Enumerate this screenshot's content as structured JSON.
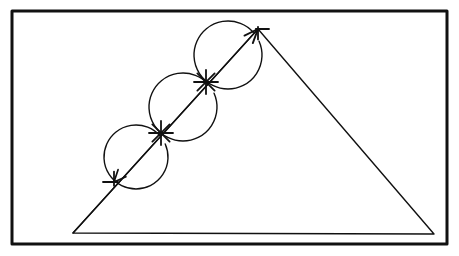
{
  "document": {
    "title": "Geometric construction diagram",
    "description": "Hand-drawn geometry figure: a triangle inside a rectangular frame, with an arrow drawn along its left side passing through three tangent circles; intersection points are marked with asterisk cross marks.",
    "background_color": "#ffffff",
    "ink_color": "#111111"
  },
  "frame": {
    "name": "outer-border",
    "x": 12,
    "y": 11,
    "width": 435,
    "height": 233,
    "stroke_width": 3,
    "color": "#111111"
  },
  "figure": {
    "type": "geometric-construction",
    "stroke_width": 1.4,
    "color": "#111111",
    "triangle": {
      "label": "triangle",
      "vertices": [
        {
          "name": "bottom-left-vertex",
          "x": 73,
          "y": 233
        },
        {
          "name": "apex-vertex",
          "x": 258,
          "y": 29
        },
        {
          "name": "bottom-right-vertex",
          "x": 434,
          "y": 234
        }
      ],
      "closed": true
    },
    "arrow": {
      "label": "double-headed-arrow-on-left-side",
      "from": {
        "x": 73,
        "y": 233
      },
      "to": {
        "x": 258,
        "y": 29
      },
      "head_top": {
        "name": "arrowhead-up",
        "tip_x": 258,
        "tip_y": 29,
        "direction": "up-right",
        "size": 15
      },
      "head_bottom": {
        "name": "arrowhead-down",
        "tip_x": 114,
        "tip_y": 182,
        "direction": "down-left",
        "size": 13
      }
    },
    "circles": [
      {
        "name": "circle-lower",
        "cx": 136,
        "cy": 157,
        "r": 32,
        "gap_start_deg": 318,
        "gap_end_deg": 336
      },
      {
        "name": "circle-middle",
        "cx": 183,
        "cy": 107,
        "r": 34,
        "gap_start_deg": 318,
        "gap_end_deg": 336
      },
      {
        "name": "circle-upper",
        "cx": 228,
        "cy": 55,
        "r": 34,
        "gap_start_deg": 318,
        "gap_end_deg": 336
      }
    ],
    "cross_marks": [
      {
        "name": "cross-mark-lower",
        "cx": 114,
        "cy": 182,
        "arm": 11,
        "style": "tick-horizontal"
      },
      {
        "name": "cross-mark-middle",
        "cx": 161,
        "cy": 133,
        "arm": 12,
        "style": "asterisk"
      },
      {
        "name": "cross-mark-upper",
        "cx": 206,
        "cy": 82,
        "arm": 12,
        "style": "asterisk"
      },
      {
        "name": "cross-mark-apex",
        "cx": 258,
        "cy": 29,
        "arm": 11,
        "style": "tick-horizontal-right"
      }
    ]
  }
}
